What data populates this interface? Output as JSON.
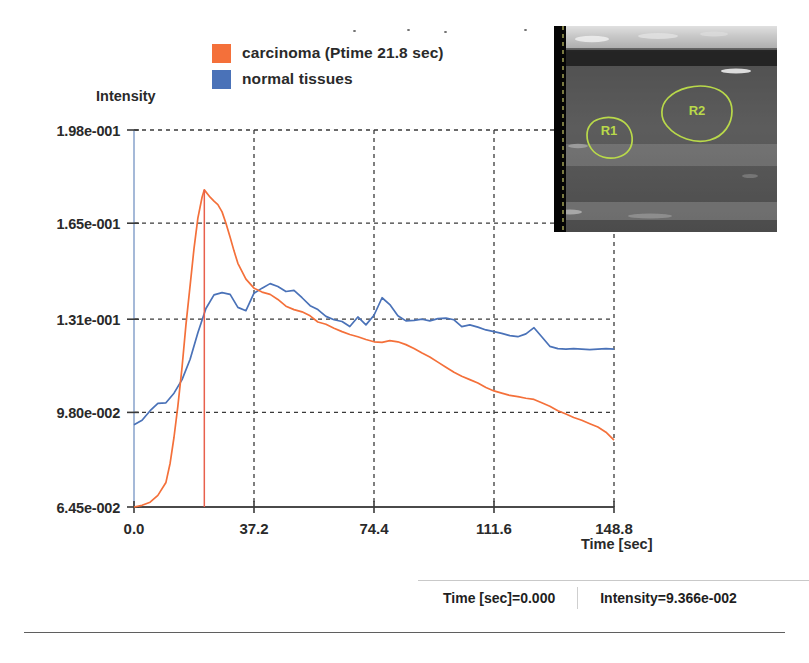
{
  "legend": {
    "items": [
      {
        "label": "carcinoma (Ptime 21.8 sec)",
        "color": "#f4703a",
        "name": "carcinoma"
      },
      {
        "label": "normal tissues",
        "color": "#4a72b8",
        "name": "normal-tissues"
      }
    ]
  },
  "axes": {
    "y_title": "Intensity",
    "x_title": "Time [sec]",
    "y_ticks": [
      "1.98e-001",
      "1.65e-001",
      "1.31e-001",
      "9.80e-002",
      "6.45e-002"
    ],
    "x_ticks": [
      "0.0",
      "37.2",
      "74.4",
      "111.6",
      "148.8"
    ]
  },
  "inset": {
    "roi_labels": [
      "R1",
      "R2"
    ],
    "roi_color": "#b9d94a"
  },
  "status": {
    "time_label": "Time [sec]=0.000",
    "intensity_label": "Intensity=9.366e-002"
  },
  "colors": {
    "carcinoma": "#f4703a",
    "normal": "#4a72b8",
    "marker": "#e8604c",
    "grid": "#3a3a3a",
    "axis": "#8fa8cf",
    "baseline": "#4a4a4a"
  },
  "chart_data": {
    "type": "line",
    "title": "",
    "xlabel": "Time [sec]",
    "ylabel": "Intensity",
    "xlim": [
      0.0,
      148.8
    ],
    "ylim": [
      0.0645,
      0.198
    ],
    "xticks": [
      0.0,
      37.2,
      74.4,
      111.6,
      148.8
    ],
    "yticks": [
      0.0645,
      0.098,
      0.131,
      0.165,
      0.198
    ],
    "grid": true,
    "legend_position": "top-left",
    "annotations": [
      {
        "type": "vline",
        "label": "Ptime",
        "x": 21.8,
        "color": "#e8604c"
      }
    ],
    "series": [
      {
        "name": "carcinoma (Ptime 21.8 sec)",
        "color": "#f4703a",
        "peak_time": 21.8,
        "peak_value": 0.1768,
        "x": [
          0.0,
          2.5,
          5.0,
          7.4,
          9.9,
          11.2,
          12.4,
          13.6,
          14.9,
          16.1,
          17.4,
          18.6,
          19.8,
          21.1,
          21.8,
          23.6,
          24.8,
          26.0,
          27.3,
          28.5,
          29.8,
          31.0,
          32.2,
          34.7,
          37.2,
          39.7,
          42.2,
          44.6,
          47.1,
          49.6,
          52.1,
          54.6,
          57.0,
          59.5,
          62.0,
          64.5,
          66.9,
          69.4,
          71.9,
          74.4,
          76.9,
          79.3,
          81.8,
          84.3,
          86.8,
          89.3,
          91.7,
          94.2,
          96.7,
          99.2,
          101.6,
          104.1,
          106.6,
          109.1,
          111.6,
          114.0,
          116.5,
          119.0,
          121.5,
          124.0,
          126.4,
          128.9,
          131.4,
          133.9,
          136.3,
          138.8,
          141.3,
          143.8,
          146.3,
          148.8
        ],
        "y": [
          0.0645,
          0.0651,
          0.0662,
          0.0686,
          0.0732,
          0.08,
          0.0892,
          0.1002,
          0.114,
          0.129,
          0.143,
          0.156,
          0.1668,
          0.1742,
          0.1768,
          0.1742,
          0.1728,
          0.1716,
          0.169,
          0.165,
          0.16,
          0.1552,
          0.1508,
          0.1452,
          0.142,
          0.1406,
          0.1398,
          0.138,
          0.1356,
          0.1344,
          0.1336,
          0.1322,
          0.13,
          0.1292,
          0.1278,
          0.1266,
          0.1256,
          0.1248,
          0.1238,
          0.123,
          0.1228,
          0.1234,
          0.123,
          0.122,
          0.1206,
          0.119,
          0.1176,
          0.1158,
          0.114,
          0.1122,
          0.1108,
          0.1096,
          0.1084,
          0.1068,
          0.1056,
          0.1048,
          0.104,
          0.1036,
          0.103,
          0.1026,
          0.1014,
          0.1002,
          0.0986,
          0.0974,
          0.0962,
          0.0952,
          0.094,
          0.0928,
          0.091,
          0.0882
        ]
      },
      {
        "name": "normal tissues",
        "color": "#4a72b8",
        "x": [
          0.0,
          2.5,
          5.0,
          7.4,
          9.9,
          12.4,
          14.9,
          17.4,
          19.8,
          22.3,
          24.8,
          27.3,
          29.8,
          32.2,
          34.7,
          37.2,
          39.7,
          42.2,
          44.6,
          47.1,
          49.6,
          52.1,
          54.6,
          57.0,
          59.5,
          62.0,
          64.5,
          66.9,
          69.4,
          71.9,
          74.4,
          76.9,
          79.3,
          81.8,
          84.3,
          86.8,
          89.3,
          91.7,
          94.2,
          96.7,
          99.2,
          101.6,
          104.1,
          106.6,
          109.1,
          111.6,
          114.0,
          116.5,
          119.0,
          121.5,
          124.0,
          126.4,
          128.9,
          131.4,
          133.9,
          136.3,
          138.8,
          141.3,
          143.8,
          146.3,
          148.8
        ],
        "y": [
          0.0936,
          0.0952,
          0.0986,
          0.1012,
          0.1014,
          0.1048,
          0.1096,
          0.1168,
          0.1262,
          0.1348,
          0.1396,
          0.1404,
          0.1398,
          0.1352,
          0.134,
          0.1402,
          0.142,
          0.1436,
          0.1426,
          0.1408,
          0.1412,
          0.1386,
          0.1358,
          0.1344,
          0.132,
          0.1308,
          0.1302,
          0.1284,
          0.1318,
          0.129,
          0.1324,
          0.1386,
          0.1362,
          0.1322,
          0.1304,
          0.1306,
          0.131,
          0.1304,
          0.1312,
          0.1314,
          0.1308,
          0.1284,
          0.129,
          0.1282,
          0.1272,
          0.1266,
          0.126,
          0.1252,
          0.1248,
          0.1258,
          0.128,
          0.1248,
          0.1214,
          0.1206,
          0.1204,
          0.1206,
          0.1204,
          0.1202,
          0.1204,
          0.1206,
          0.1204
        ]
      }
    ]
  }
}
